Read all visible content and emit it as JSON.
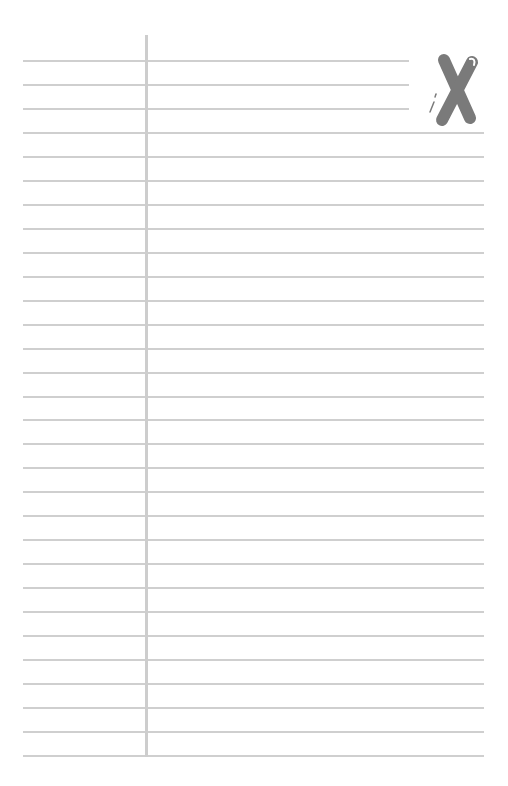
{
  "page": {
    "type": "lined-paper",
    "background": "#ffffff",
    "line_color": "#cfcfcf",
    "margin_color": "#cdcdcd",
    "mark_color": "#7a7a7a"
  },
  "lines": {
    "count": 30,
    "first_y": 61,
    "last_y": 756,
    "left_x": 23,
    "right_x": 484,
    "short_right_x": 409,
    "short_count": 3
  },
  "margin": {
    "x": 145,
    "top_y": 35,
    "bottom_y": 757
  },
  "mark": {
    "icon": "x-mark-icon",
    "label": ""
  }
}
